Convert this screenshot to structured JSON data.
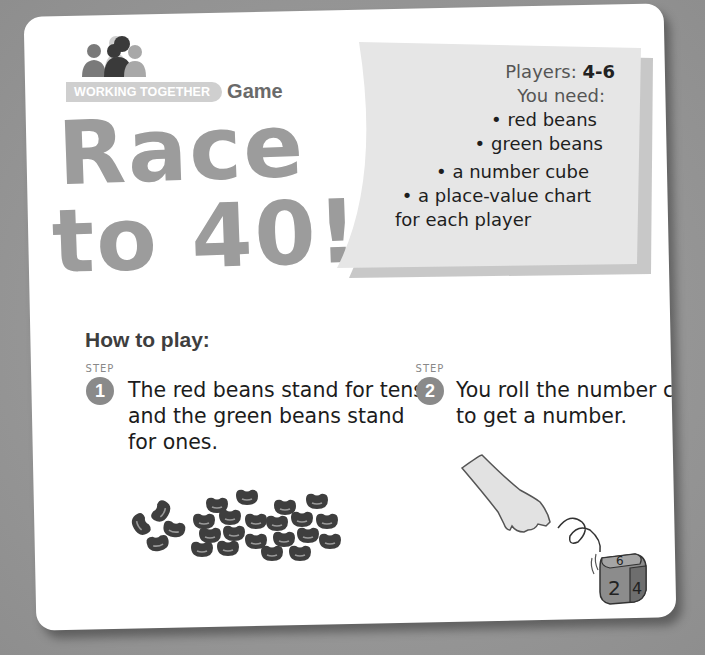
{
  "header": {
    "badge_label": "WORKING TOGETHER",
    "badge_suffix": "Game",
    "icon": "people-group-icon"
  },
  "title": {
    "line1": "Race",
    "line2": "to 40!"
  },
  "requirements": {
    "players_label": "Players:",
    "players_value": "4-6",
    "need_label": "You need:",
    "items": [
      "• red beans",
      "• green beans",
      "• a number cube",
      "• a place-value chart",
      "for each player"
    ]
  },
  "instructions": {
    "heading": "How to play:",
    "step_word": "STEP",
    "steps": [
      {
        "number": "1",
        "text": "The red beans stand for tens and the green beans stand for ones.",
        "illustration": "beans-illustration"
      },
      {
        "number": "2",
        "text": "You roll the number cube to get a number.",
        "illustration": "hand-rolling-die-illustration"
      }
    ]
  },
  "die_faces": {
    "top": "6",
    "front": "2",
    "side": "4"
  },
  "colors": {
    "background": "#9a9a9a",
    "card": "#ffffff",
    "title": "#9c9c9c",
    "note": "#e6e6e6",
    "step_circle": "#8a8a8a",
    "text": "#1c1c1c"
  }
}
